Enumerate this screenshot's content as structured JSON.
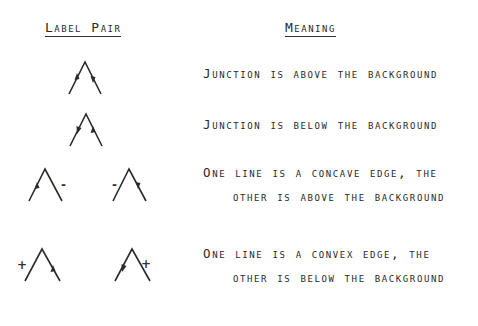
{
  "headers": {
    "label_pair": "Label Pair",
    "meaning": "Meaning"
  },
  "rows": [
    {
      "glyphs": [
        {
          "shape": "junction-arrows",
          "left_arrow": "up",
          "right_arrow": "down",
          "sign": ""
        }
      ],
      "meaning_line1": "Junction is above the background",
      "meaning_line2": ""
    },
    {
      "glyphs": [
        {
          "shape": "junction-arrows",
          "left_arrow": "down",
          "right_arrow": "up",
          "sign": ""
        }
      ],
      "meaning_line1": "Junction is below the background",
      "meaning_line2": ""
    },
    {
      "glyphs": [
        {
          "shape": "junction-arrow-minus",
          "arrow_line": "left",
          "arrow": "up",
          "sign": "-",
          "sign_side": "right"
        },
        {
          "shape": "junction-arrow-minus",
          "arrow_line": "right",
          "arrow": "down",
          "sign": "-",
          "sign_side": "left"
        }
      ],
      "meaning_line1": "One line is a concave edge, the",
      "meaning_line2": "other is above the background"
    },
    {
      "glyphs": [
        {
          "shape": "junction-arrow-plus",
          "arrow_line": "right",
          "arrow": "up",
          "sign": "+",
          "sign_side": "left"
        },
        {
          "shape": "junction-arrow-plus",
          "arrow_line": "left",
          "arrow": "down",
          "sign": "+",
          "sign_side": "right"
        }
      ],
      "meaning_line1": "One line is a convex edge, the",
      "meaning_line2": "other is below the background"
    }
  ],
  "colors": {
    "ink": "#2a2a2a",
    "paper": "#ffffff"
  }
}
